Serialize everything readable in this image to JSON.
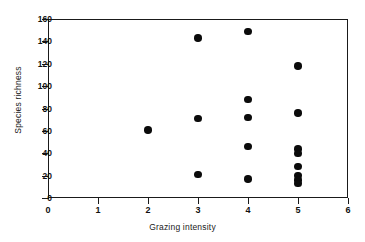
{
  "chart_data": {
    "type": "scatter",
    "title": "",
    "xlabel": "Grazing intensity",
    "ylabel": "Species richness",
    "xlim": [
      0,
      6
    ],
    "ylim": [
      0,
      160
    ],
    "xticks": [
      0,
      1,
      2,
      3,
      4,
      5,
      6
    ],
    "yticks": [
      0,
      20,
      40,
      60,
      80,
      100,
      120,
      140,
      160
    ],
    "grid": false,
    "legend": null,
    "marker": "filled-circle",
    "marker_color": "#0b0b0b",
    "series": [
      {
        "name": "observations",
        "points": [
          {
            "x": 2,
            "y": 61
          },
          {
            "x": 3,
            "y": 143
          },
          {
            "x": 3,
            "y": 71
          },
          {
            "x": 3,
            "y": 21
          },
          {
            "x": 4,
            "y": 149
          },
          {
            "x": 4,
            "y": 88
          },
          {
            "x": 4,
            "y": 72
          },
          {
            "x": 4,
            "y": 46
          },
          {
            "x": 4,
            "y": 17
          },
          {
            "x": 5,
            "y": 118
          },
          {
            "x": 5,
            "y": 76
          },
          {
            "x": 5,
            "y": 44
          },
          {
            "x": 5,
            "y": 40
          },
          {
            "x": 5,
            "y": 28
          },
          {
            "x": 5,
            "y": 20
          },
          {
            "x": 5,
            "y": 16
          },
          {
            "x": 5,
            "y": 13
          }
        ]
      }
    ]
  },
  "axis": {
    "x_tick_labels": [
      "0",
      "1",
      "2",
      "3",
      "4",
      "5",
      "6"
    ],
    "y_tick_labels": [
      "0",
      "20",
      "40",
      "60",
      "80",
      "100",
      "120",
      "140",
      "160"
    ],
    "x_title": "Grazing intensity",
    "y_title": "Species richness"
  }
}
